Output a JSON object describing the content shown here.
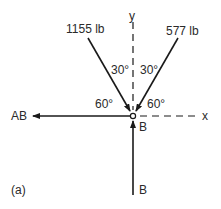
{
  "figure": {
    "panel_label": "(a)",
    "axes": {
      "x_label": "x",
      "y_label": "y"
    },
    "node_label": "B",
    "forces": [
      {
        "name": "left-member-force",
        "label": "1155 lb",
        "angle_from_y": "30°",
        "angle_from_x": "60°"
      },
      {
        "name": "right-member-force",
        "label": "577 lb",
        "angle_from_y": "30°",
        "angle_from_x": "60°"
      },
      {
        "name": "horizontal-force",
        "label": "AB"
      },
      {
        "name": "vertical-force",
        "label": "B"
      }
    ],
    "colors": {
      "line": "#1a1a1a",
      "text": "#2a2a2a",
      "background": "#ffffff"
    }
  }
}
